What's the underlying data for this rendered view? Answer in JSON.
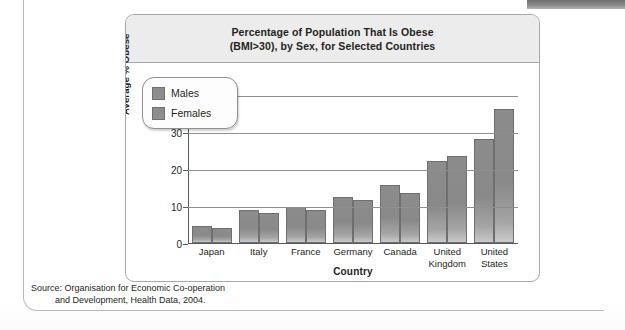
{
  "figure": {
    "title_line1": "Percentage of Population That Is Obese",
    "title_line2": "(BMI>30), by Sex, for Selected Countries",
    "source_line1": "Source: Organisation for Economic Co-operation",
    "source_line2": "and Development, Health Data, 2004."
  },
  "legend": {
    "items": [
      {
        "label": "Males"
      },
      {
        "label": "Females"
      }
    ]
  },
  "chart_data": {
    "type": "bar",
    "title": "Percentage of Population That Is Obese (BMI>30), by Sex, for Selected Countries",
    "xlabel": "Country",
    "ylabel": "Average % Obese",
    "categories": [
      "Japan",
      "Italy",
      "France",
      "Germany",
      "Canada",
      "United Kingdom",
      "United States"
    ],
    "category_lines": [
      [
        "Japan"
      ],
      [
        "Italy"
      ],
      [
        "France"
      ],
      [
        "Germany"
      ],
      [
        "Canada"
      ],
      [
        "United",
        "Kingdom"
      ],
      [
        "United",
        "States"
      ]
    ],
    "series": [
      {
        "name": "Males",
        "values": [
          4.5,
          9.0,
          9.8,
          12.5,
          15.5,
          22.0,
          28.0
        ]
      },
      {
        "name": "Females",
        "values": [
          4.0,
          8.0,
          9.0,
          11.5,
          13.5,
          23.5,
          36.0
        ]
      }
    ],
    "ylim": [
      0,
      45
    ],
    "yticks": [
      0,
      10,
      20,
      30,
      40
    ],
    "ytick_labels": [
      "0",
      "10",
      "20",
      "30",
      "40"
    ],
    "grid": true,
    "legend_position": "top-left-inside",
    "bar_color": "#8c8c8c",
    "bar_border_color": "#6f6f6f"
  }
}
